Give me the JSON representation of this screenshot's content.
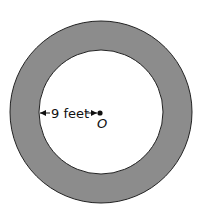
{
  "diagram": {
    "shape": "annulus",
    "outer_fill": "#8c8c8c",
    "inner_fill": "#ffffff",
    "stroke": "#222222",
    "radius_label": "9 feet",
    "center_label": "O"
  }
}
